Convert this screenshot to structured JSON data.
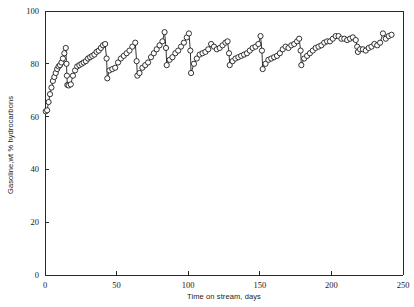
{
  "chart_data": {
    "type": "line",
    "title": "",
    "xlabel": "Time on stream, days",
    "ylabel": "Gasoline,wt % hydrocarbons",
    "xlim": [
      0,
      250
    ],
    "ylim": [
      0,
      100
    ],
    "xticks": [
      0,
      50,
      100,
      150,
      200,
      250
    ],
    "yticks": [
      0,
      20,
      40,
      60,
      80,
      100
    ],
    "xtick_labels": [
      "0",
      "50",
      "100",
      "150",
      "200",
      "250"
    ],
    "ytick_labels": [
      "0",
      "20",
      "40",
      "60",
      "80",
      "100"
    ],
    "grid": false,
    "legend": false,
    "marker": "open-circle",
    "marker_size": 2.6,
    "line_color": "#111111",
    "marker_fill": "#ffffff",
    "series": [
      {
        "name": "Gasoline yield",
        "x": [
          0.5,
          1.5,
          2.5,
          3.5,
          4.5,
          5.5,
          6.5,
          7.5,
          8.5,
          9.5,
          10.5,
          11.5,
          12.5,
          13.5,
          14.5,
          15.0,
          15.3,
          15.6,
          16.5,
          18.0,
          19.5,
          21.0,
          22.5,
          24.0,
          25.5,
          27.0,
          28.5,
          30.0,
          31.5,
          33.0,
          34.5,
          36.0,
          37.5,
          39.0,
          40.5,
          42.0,
          43.0,
          43.5,
          45.0,
          47.0,
          49.0,
          51.0,
          53.0,
          55.0,
          57.0,
          59.0,
          61.0,
          63.0,
          64.0,
          64.5,
          66.0,
          68.0,
          70.0,
          72.0,
          74.0,
          76.0,
          78.0,
          80.0,
          82.0,
          83.5,
          84.5,
          85.0,
          87.0,
          89.0,
          91.0,
          93.0,
          95.0,
          97.0,
          99.0,
          100.5,
          101.5,
          102.0,
          104.0,
          106.0,
          108.0,
          110.0,
          112.0,
          114.0,
          116.0,
          118.0,
          120.0,
          122.0,
          124.0,
          126.0,
          127.5,
          128.5,
          129.0,
          131.0,
          133.0,
          135.0,
          137.0,
          139.0,
          141.0,
          143.0,
          145.0,
          147.0,
          149.0,
          150.5,
          151.5,
          152.0,
          154.0,
          156.0,
          158.0,
          160.0,
          162.0,
          164.0,
          166.0,
          168.0,
          170.0,
          172.0,
          174.0,
          176.0,
          177.5,
          178.5,
          179.0,
          181.0,
          183.0,
          185.0,
          187.0,
          189.0,
          191.0,
          193.0,
          195.0,
          197.0,
          199.0,
          201.0,
          203.0,
          205.0,
          207.0,
          209.0,
          211.0,
          213.0,
          215.0,
          217.0,
          218.0,
          218.5,
          220.0,
          222.0,
          224.0,
          226.0,
          228.0,
          230.0,
          232.0,
          234.0,
          236.0,
          238.0,
          240.0,
          242.0
        ],
        "y": [
          62.0,
          62.4,
          65.5,
          68.5,
          71.0,
          73.5,
          75.0,
          76.5,
          78.0,
          79.0,
          79.5,
          80.5,
          82.0,
          84.0,
          86.0,
          80.0,
          75.5,
          72.0,
          71.8,
          72.2,
          75.5,
          77.5,
          79.0,
          79.5,
          80.0,
          80.5,
          81.0,
          82.0,
          82.5,
          83.0,
          83.5,
          84.5,
          85.0,
          86.0,
          87.0,
          87.5,
          82.0,
          74.5,
          77.5,
          78.0,
          78.5,
          80.5,
          82.0,
          83.0,
          84.0,
          85.0,
          86.5,
          88.0,
          81.0,
          75.5,
          76.5,
          78.5,
          79.5,
          80.5,
          82.5,
          84.0,
          85.5,
          87.0,
          88.5,
          92.0,
          86.0,
          79.5,
          81.5,
          82.5,
          84.0,
          85.0,
          86.5,
          88.0,
          90.0,
          91.5,
          85.0,
          76.5,
          80.0,
          82.0,
          83.5,
          84.0,
          84.5,
          85.5,
          87.5,
          86.5,
          85.5,
          86.0,
          87.0,
          88.0,
          88.5,
          84.0,
          79.5,
          81.0,
          82.0,
          82.5,
          83.0,
          83.5,
          84.0,
          85.0,
          86.0,
          86.5,
          87.5,
          90.5,
          85.0,
          78.0,
          80.0,
          81.5,
          82.0,
          82.5,
          83.0,
          84.0,
          85.5,
          86.5,
          86.0,
          87.0,
          87.5,
          88.5,
          89.5,
          85.0,
          79.5,
          82.0,
          83.0,
          84.0,
          85.0,
          86.0,
          86.5,
          87.0,
          88.0,
          88.5,
          88.5,
          89.5,
          90.5,
          90.5,
          89.5,
          89.5,
          89.0,
          89.5,
          90.0,
          89.0,
          86.5,
          84.5,
          85.5,
          85.5,
          85.0,
          86.0,
          86.5,
          87.5,
          87.0,
          88.0,
          91.5,
          89.5,
          90.5,
          91.0
        ]
      }
    ]
  },
  "axes": {
    "x_title": "Time on stream, days",
    "y_title": "Gasoline,wt % hydrocarbons"
  }
}
